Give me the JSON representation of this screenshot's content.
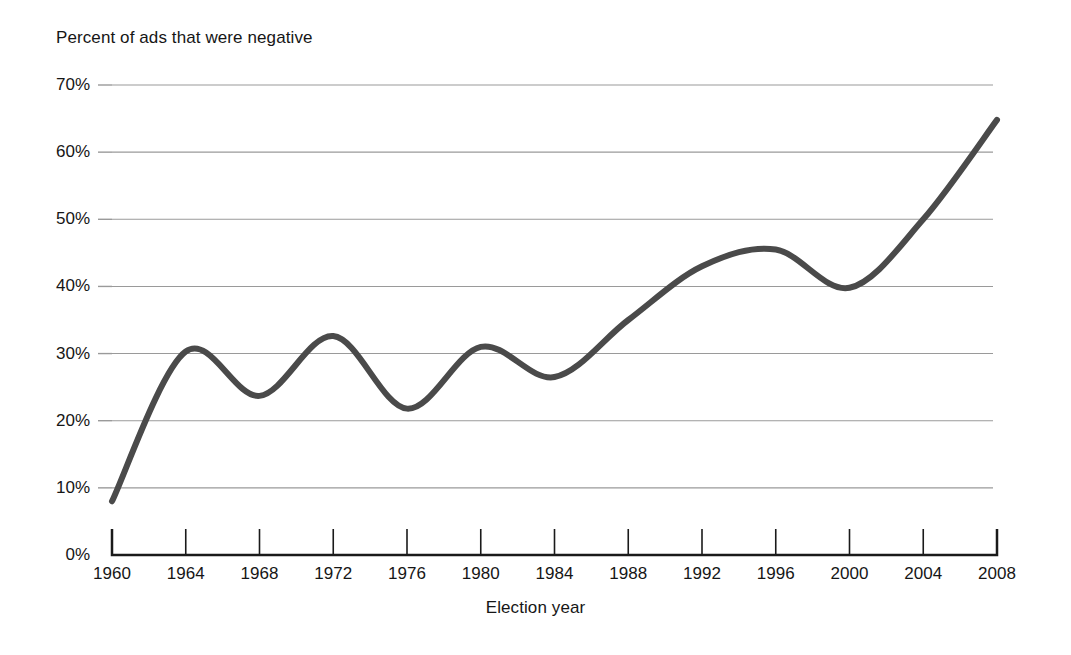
{
  "chart_data": {
    "type": "line",
    "title": "",
    "ylabel": "Percent of ads that were negative",
    "xlabel": "Election year",
    "x": [
      1960,
      1964,
      1968,
      1972,
      1976,
      1980,
      1984,
      1988,
      1992,
      1996,
      2000,
      2004,
      2008
    ],
    "values": [
      8,
      30.3,
      23.7,
      32.6,
      21.8,
      31,
      26.5,
      35,
      43,
      45.5,
      39.8,
      50,
      64.8
    ],
    "series": [
      {
        "name": "Percent of ads that were negative",
        "values": [
          8,
          30.3,
          23.7,
          32.6,
          21.8,
          31,
          26.5,
          35,
          43,
          45.5,
          39.8,
          50,
          64.8
        ]
      }
    ],
    "categories": [
      "1960",
      "1964",
      "1968",
      "1972",
      "1976",
      "1980",
      "1984",
      "1988",
      "1992",
      "1996",
      "2000",
      "2004",
      "2008"
    ],
    "xlim": [
      1960,
      2008
    ],
    "ylim": [
      0,
      70
    ],
    "ytick_values": [
      0,
      10,
      20,
      30,
      40,
      50,
      60,
      70
    ],
    "ytick_labels": [
      "0%",
      "10%",
      "20%",
      "30%",
      "40%",
      "50%",
      "60%",
      "70%"
    ],
    "xtick_labels": [
      "1960",
      "1964",
      "1968",
      "1972",
      "1976",
      "1980",
      "1984",
      "1988",
      "1992",
      "1996",
      "2000",
      "2004",
      "2008"
    ],
    "grid": "horizontal",
    "legend": "none",
    "line_color": "#4a4a4a",
    "line_width": 6,
    "grid_color": "#9a9a9a",
    "axis_color": "#1a1a1a",
    "background_color": "#ffffff",
    "smoothing": "spline"
  },
  "axes": {
    "y_title": "Percent of ads that were negative",
    "x_title": "Election year",
    "y_labels": [
      "70%",
      "60%",
      "50%",
      "40%",
      "30%",
      "20%",
      "10%",
      "0%"
    ],
    "x_labels": [
      "1960",
      "1964",
      "1968",
      "1972",
      "1976",
      "1980",
      "1984",
      "1988",
      "1992",
      "1996",
      "2000",
      "2004",
      "2008"
    ]
  }
}
